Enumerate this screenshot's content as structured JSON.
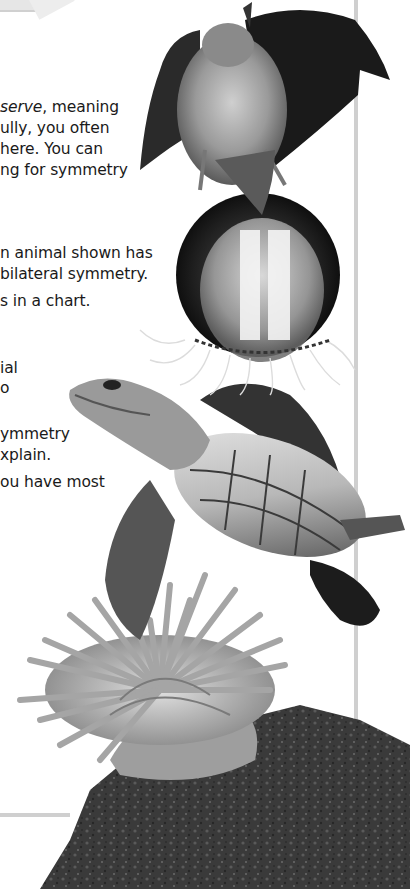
{
  "page": {
    "type": "textbook-page-crop",
    "colors": {
      "background": "#ffffff",
      "text": "#1a1a1a",
      "rule": "#cfcfcf"
    }
  },
  "paragraph": {
    "lines": [
      {
        "italic": "serve",
        "text": ", meaning",
        "prefix": ""
      },
      {
        "text": "ully, you often"
      },
      {
        "text": "here. You can"
      },
      {
        "text": "ng for symmetry"
      }
    ]
  },
  "activity": {
    "lines": [
      {
        "text": "n animal shown has"
      },
      {
        "text": "bilateral symmetry."
      },
      {
        "text": "s in a chart."
      },
      {
        "text": "ial"
      },
      {
        "text": "o"
      },
      {
        "text": "ymmetry"
      },
      {
        "text": "xplain."
      },
      {
        "text": "ou have most"
      }
    ]
  },
  "images": [
    {
      "name": "bat",
      "description": "bat with outstretched wings"
    },
    {
      "name": "comb-jelly",
      "description": "translucent comb jelly in dark sphere"
    },
    {
      "name": "sea-turtle",
      "description": "sea turtle swimming"
    },
    {
      "name": "sea-anemone",
      "description": "sea anemone on a rock"
    }
  ]
}
